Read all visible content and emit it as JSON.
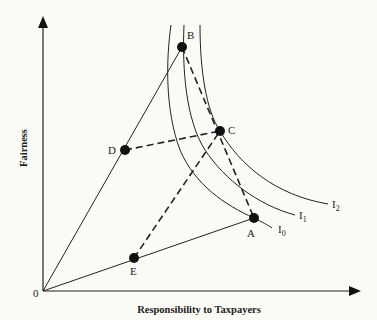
{
  "diagram": {
    "type": "indifference-curve-diagram",
    "axes": {
      "x_label": "Responsibility to Taxpayers",
      "y_label": "Fairness",
      "origin_label": "0"
    },
    "points": [
      {
        "id": "A",
        "label": "A"
      },
      {
        "id": "B",
        "label": "B"
      },
      {
        "id": "C",
        "label": "C"
      },
      {
        "id": "D",
        "label": "D"
      },
      {
        "id": "E",
        "label": "E"
      }
    ],
    "curves": [
      {
        "id": "I0",
        "label": "I",
        "sub": "0"
      },
      {
        "id": "I1",
        "label": "I",
        "sub": "1"
      },
      {
        "id": "I2",
        "label": "I",
        "sub": "2"
      }
    ],
    "solid_lines": [
      "0-B",
      "0-A"
    ],
    "dashed_lines": [
      "B-A",
      "D-C",
      "E-C"
    ]
  },
  "colors": {
    "background": "#fbfbf6",
    "ink": "#222222"
  }
}
